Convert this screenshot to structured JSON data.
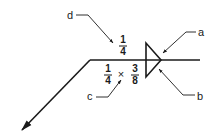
{
  "diagram": {
    "type": "welding-symbol",
    "labels": {
      "a": "a",
      "b": "b",
      "c": "c",
      "d": "d"
    },
    "arrow_side": {
      "size_leg1": {
        "num": "1",
        "den": "4"
      },
      "separator": "×",
      "size_leg2": {
        "num": "3",
        "den": "8"
      }
    },
    "other_side": {
      "size": {
        "num": "1",
        "den": "4"
      }
    },
    "weld_symbol": "fillet-triangle",
    "colors": {
      "ink": "#1a1a1a",
      "background": "#ffffff"
    }
  }
}
